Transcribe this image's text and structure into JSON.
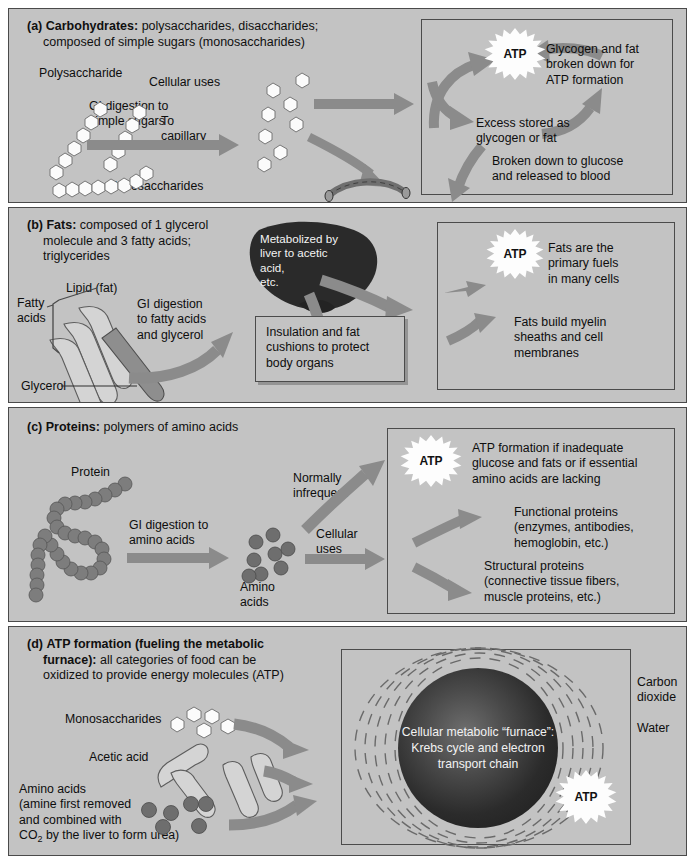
{
  "colors": {
    "panel_bg": "#c3c3c3",
    "page_bg": "#ffffff",
    "arrow": "#8b8b8b",
    "border": "#4a4a4a",
    "text": "#101010",
    "atp_star": "#fdfdfd",
    "furnace_dark": "#1b1b1b"
  },
  "panels": [
    {
      "id": "a",
      "marker": "(a)",
      "heading_bold": "Carbohydrates:",
      "heading_rest": " polysaccharides, disaccharides;",
      "heading_line2": "composed of simple sugars (monosaccharides)",
      "labels": {
        "polysaccharide": "Polysaccharide",
        "digestion": "GI digestion to\nsimple sugars",
        "monosaccharides": "Monosaccharides",
        "cellular_uses": "Cellular uses",
        "to_capillary": "To\ncapillary"
      },
      "right_box": {
        "atp": "ATP",
        "glycogen_fat": "Glycogen and fat\nbroken down for\nATP formation",
        "excess_stored": "Excess stored as\nglycogen or fat",
        "broken_down": "Broken down to glucose\nand released to blood"
      }
    },
    {
      "id": "b",
      "marker": "(b)",
      "heading_bold": "Fats:",
      "heading_rest": " composed of 1 glycerol",
      "heading_line2": "molecule and 3 fatty acids;",
      "heading_line3": "triglycerides",
      "labels": {
        "lipid": "Lipid (fat)",
        "fatty_acids": "Fatty\nacids",
        "glycerol": "Glycerol",
        "digestion": "GI digestion\nto fatty acids\nand glycerol",
        "liver": "Metabolized by\nliver to acetic\nacid,\netc.",
        "cellular_uses": "Cellular\nuses"
      },
      "insulation_box": "Insulation and fat\ncushions to protect\nbody organs",
      "right_box": {
        "atp": "ATP",
        "primary_fuels": "Fats are the\nprimary fuels\nin many cells",
        "myelin": "Fats build myelin\nsheaths and cell\nmembranes"
      }
    },
    {
      "id": "c",
      "marker": "(c)",
      "heading_bold": "Proteins:",
      "heading_rest": " polymers of amino acids",
      "labels": {
        "protein": "Protein",
        "digestion": "GI digestion to\namino acids",
        "amino_acids": "Amino\nacids",
        "normally_infrequent": "Normally\ninfrequent",
        "cellular_uses": "Cellular\nuses"
      },
      "right_box": {
        "atp": "ATP",
        "atp_formation": "ATP formation if inadequate\nglucose and fats or if essential\namino acids are lacking",
        "functional": "Functional proteins\n(enzymes, antibodies,\nhemoglobin, etc.)",
        "structural": "Structural proteins\n(connective tissue fibers,\nmuscle proteins, etc.)"
      }
    },
    {
      "id": "d",
      "marker": "(d)",
      "heading_bold": "ATP formation (fueling the metabolic",
      "heading_bold2": "furnace):",
      "heading_rest": " all categories of food can be",
      "heading_line3": "oxidized to provide energy molecules (ATP)",
      "labels": {
        "monosaccharides": "Monosaccharides",
        "acetic_acid": "Acetic acid",
        "amino_acids": "Amino acids\n(amine first removed\nand combined with",
        "amino_acids_last": " by the liver to form urea)",
        "co2": "CO",
        "co2_sub": "2"
      },
      "furnace": "Cellular\nmetabolic “furnace”:\nKrebs cycle\nand\nelectron transport\nchain",
      "outputs": {
        "carbon_dioxide": "Carbon\ndioxide",
        "water": "Water",
        "atp": "ATP"
      }
    }
  ]
}
